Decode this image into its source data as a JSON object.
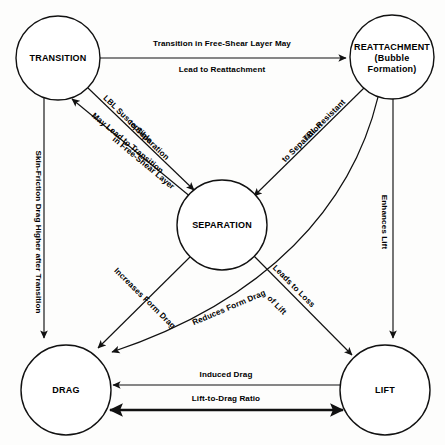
{
  "diagram": {
    "type": "concept-flow-diagram",
    "stroke_color": "#111111",
    "fill_color": "#ffffff",
    "background_color": "#fdfdfc",
    "nodes": [
      {
        "id": "transition",
        "label_lines": [
          "TRANSITION"
        ],
        "line1": "TRANSITION",
        "line2": "",
        "line3": "",
        "cx": 58,
        "cy": 58,
        "r": 42
      },
      {
        "id": "reattachment",
        "label_lines": [
          "REATTACHMENT",
          "(Bubble",
          "Formation)"
        ],
        "line1": "REATTACHMENT",
        "line2": "(Bubble",
        "line3": "Formation)",
        "cx": 392,
        "cy": 57,
        "r": 42
      },
      {
        "id": "separation",
        "label_lines": [
          "SEPARATION"
        ],
        "line1": "SEPARATION",
        "line2": "",
        "line3": "",
        "cx": 222,
        "cy": 225,
        "r": 45
      },
      {
        "id": "drag",
        "label_lines": [
          "DRAG"
        ],
        "line1": "DRAG",
        "line2": "",
        "line3": "",
        "cx": 66,
        "cy": 390,
        "r": 45
      },
      {
        "id": "lift",
        "label_lines": [
          "LIFT"
        ],
        "line1": "LIFT",
        "line2": "",
        "line3": "",
        "cx": 385,
        "cy": 390,
        "r": 45
      }
    ],
    "edges": [
      {
        "id": "transition-to-reattachment",
        "from": "transition",
        "to": "reattachment",
        "arrow": "forward",
        "weight": "normal",
        "label_line1": "Transition in Free-Shear Layer May",
        "label_line2": "Lead to Reattachment"
      },
      {
        "id": "transition-to-separation",
        "from": "transition",
        "to": "separation",
        "arrow": "forward",
        "weight": "normal",
        "label_line1": "LBL Susceptible",
        "label_line2": "to Separation"
      },
      {
        "id": "separation-to-transition",
        "from": "separation",
        "to": "transition",
        "arrow": "forward",
        "weight": "normal",
        "label_line1": "May Lead to Transition",
        "label_line2": "in Free-Shear Layer"
      },
      {
        "id": "reattachment-to-separation",
        "from": "reattachment",
        "to": "separation",
        "arrow": "forward",
        "weight": "normal",
        "label_line1": "TBL Resistant",
        "label_line2": "to Separation"
      },
      {
        "id": "transition-to-drag",
        "from": "transition",
        "to": "drag",
        "arrow": "forward",
        "weight": "normal",
        "label_line1": "Skin-Friction Drag Higher after Transition",
        "label_line2": ""
      },
      {
        "id": "reattachment-to-lift",
        "from": "reattachment",
        "to": "lift",
        "arrow": "forward",
        "weight": "normal",
        "label_line1": "Enhances Lift",
        "label_line2": ""
      },
      {
        "id": "separation-to-drag",
        "from": "separation",
        "to": "drag",
        "arrow": "forward",
        "weight": "normal",
        "label_line1": "Increases Form Drag",
        "label_line2": ""
      },
      {
        "id": "reattachment-to-drag",
        "from": "reattachment",
        "to": "drag",
        "arrow": "forward",
        "weight": "normal",
        "label_line1": "Reduces Form Drag",
        "label_line2": ""
      },
      {
        "id": "separation-to-lift",
        "from": "separation",
        "to": "lift",
        "arrow": "forward",
        "weight": "normal",
        "label_line1": "Leads to Loss",
        "label_line2": "of Lift"
      },
      {
        "id": "lift-to-drag-induced",
        "from": "lift",
        "to": "drag",
        "arrow": "forward",
        "weight": "normal",
        "label_line1": "Induced Drag",
        "label_line2": ""
      },
      {
        "id": "lift-drag-ratio",
        "from": "drag",
        "to": "lift",
        "arrow": "both",
        "weight": "thick",
        "label_line1": "Lift-to-Drag Ratio",
        "label_line2": ""
      }
    ]
  }
}
